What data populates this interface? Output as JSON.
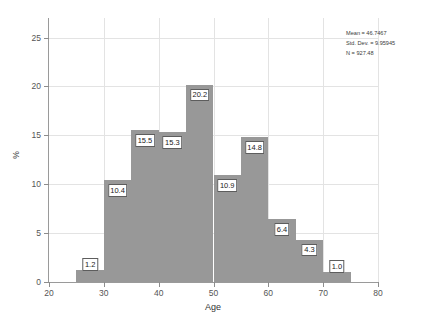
{
  "chart_data": {
    "type": "bar",
    "title": "",
    "xlabel": "Age",
    "ylabel": "%",
    "xlim": [
      20,
      80
    ],
    "ylim": [
      0,
      27
    ],
    "grid": true,
    "bin_width": 5,
    "categories": [
      "25-30",
      "30-35",
      "35-40",
      "40-45",
      "45-50",
      "50-55",
      "55-60",
      "60-65",
      "65-70",
      "70-75"
    ],
    "bin_starts": [
      25,
      30,
      35,
      40,
      45,
      50,
      55,
      60,
      65,
      70
    ],
    "values": [
      1.2,
      10.4,
      15.5,
      15.3,
      20.2,
      10.9,
      14.8,
      6.4,
      4.3,
      1.0
    ],
    "value_labels": [
      "1.2",
      "10.4",
      "15.5",
      "15.3",
      "20.2",
      "10.9",
      "14.8",
      "6.4",
      "4.3",
      "1.0"
    ],
    "xticks": [
      20,
      30,
      40,
      50,
      60,
      70,
      80
    ],
    "xtick_labels": [
      "20",
      "30",
      "40",
      "50",
      "60",
      "70",
      "80"
    ],
    "yticks": [
      0,
      5,
      10,
      15,
      20,
      25
    ],
    "ytick_labels": [
      "0",
      "5",
      "10",
      "15",
      "20",
      "25"
    ],
    "bar_color": "#989898",
    "grid_color": "#e3e3e3",
    "axis_color": "#9a9a9a"
  },
  "stats": {
    "mean": "Mean = 46.7467",
    "std_dev": "Std. Dev. = 9.95945",
    "n": "N = 927.48"
  }
}
